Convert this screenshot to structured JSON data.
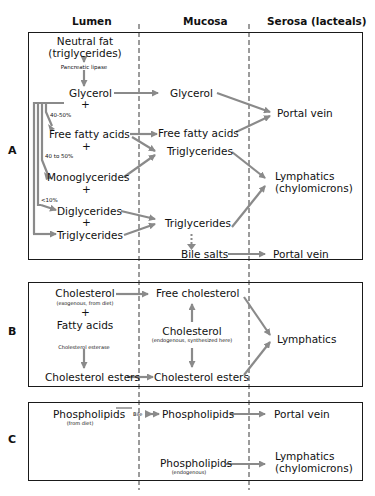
{
  "columns": {
    "lumen": "Lumen",
    "mucosa": "Mucosa",
    "serosa": "Serosa (lacteals)"
  },
  "sections": {
    "A": {
      "label": "A",
      "lumen": {
        "neutral_fat": "Neutral fat",
        "neutral_fat_sub": "(triglycerides)",
        "enzyme": "Pancreatic lipase",
        "glycerol": "Glycerol",
        "plus1": "+",
        "pct1": "40-50%",
        "free_fatty_acids": "Free fatty acids",
        "plus2": "+",
        "pct2": "40 to 50%",
        "monoglycerides": "Monoglycerides",
        "plus3": "+",
        "pct3": "<10%",
        "diglycerides": "Diglycerides",
        "plus4": "+",
        "triglycerides": "Triglycerides"
      },
      "mucosa": {
        "glycerol": "Glycerol",
        "free_fatty_acids": "Free fatty acids",
        "triglycerides1": "Triglycerides",
        "triglycerides2": "Triglycerides",
        "bile_salts": "Bile salts"
      },
      "serosa": {
        "portal_vein1": "Portal vein",
        "lymphatics": "Lymphatics",
        "lymphatics_sub": "(chylomicrons)",
        "portal_vein2": "Portal vein"
      }
    },
    "B": {
      "label": "B",
      "lumen": {
        "cholesterol": "Cholesterol",
        "cholesterol_sub": "(exogenous, from diet)",
        "plus": "+",
        "fatty_acids": "Fatty acids",
        "enzyme": "Cholesterol esterase",
        "cholesterol_esters": "Cholesterol esters"
      },
      "mucosa": {
        "free_cholesterol": "Free cholesterol",
        "cholesterol": "Cholesterol",
        "cholesterol_sub": "(endogenous, synthesized here)",
        "cholesterol_esters": "Cholesterol esters"
      },
      "serosa": {
        "lymphatics": "Lymphatics"
      }
    },
    "C": {
      "label": "C",
      "lumen": {
        "phospholipids": "Phospholipids",
        "phospholipids_sub": "(from diet)",
        "bile": "Bile"
      },
      "mucosa": {
        "phospholipids": "Phospholipids",
        "phospholipids2": "Phospholipids",
        "phospholipids2_sub": "(endogenous)"
      },
      "serosa": {
        "portal_vein": "Portal vein",
        "lymphatics": "Lymphatics",
        "lymphatics_sub": "(chylomicrons)"
      }
    }
  },
  "colors": {
    "arrow": "#8a8a8a",
    "border": "#1a1a1a",
    "text": "#111111"
  }
}
